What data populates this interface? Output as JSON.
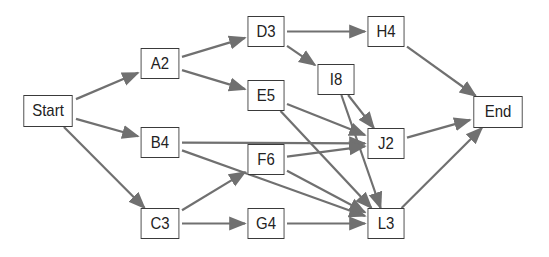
{
  "diagram": {
    "type": "network-flow",
    "edge_color": "#707070",
    "nodes": [
      {
        "id": "Start",
        "label": "Start",
        "x": 20,
        "y": 95,
        "w": 56,
        "h": 32
      },
      {
        "id": "A2",
        "label": "A2",
        "x": 138,
        "y": 48,
        "w": 44,
        "h": 31
      },
      {
        "id": "B4",
        "label": "B4",
        "x": 138,
        "y": 127,
        "w": 44,
        "h": 31
      },
      {
        "id": "C3",
        "label": "C3",
        "x": 138,
        "y": 208,
        "w": 44,
        "h": 31
      },
      {
        "id": "D3",
        "label": "D3",
        "x": 245,
        "y": 16,
        "w": 42,
        "h": 31
      },
      {
        "id": "E5",
        "label": "E5",
        "x": 245,
        "y": 80,
        "w": 42,
        "h": 31
      },
      {
        "id": "F6",
        "label": "F6",
        "x": 245,
        "y": 144,
        "w": 42,
        "h": 31
      },
      {
        "id": "G4",
        "label": "G4",
        "x": 245,
        "y": 208,
        "w": 42,
        "h": 31
      },
      {
        "id": "H4",
        "label": "H4",
        "x": 365,
        "y": 16,
        "w": 42,
        "h": 31
      },
      {
        "id": "I8",
        "label": "I8",
        "x": 315,
        "y": 64,
        "w": 42,
        "h": 31
      },
      {
        "id": "J2",
        "label": "J2",
        "x": 365,
        "y": 128,
        "w": 42,
        "h": 31
      },
      {
        "id": "L3",
        "label": "L3",
        "x": 365,
        "y": 208,
        "w": 42,
        "h": 31
      },
      {
        "id": "End",
        "label": "End",
        "x": 470,
        "y": 96,
        "w": 56,
        "h": 32
      }
    ],
    "edges": [
      {
        "from": "Start",
        "to": "A2"
      },
      {
        "from": "Start",
        "to": "B4"
      },
      {
        "from": "Start",
        "to": "C3"
      },
      {
        "from": "A2",
        "to": "D3"
      },
      {
        "from": "A2",
        "to": "E5"
      },
      {
        "from": "D3",
        "to": "H4"
      },
      {
        "from": "D3",
        "to": "I8"
      },
      {
        "from": "H4",
        "to": "End"
      },
      {
        "from": "E5",
        "to": "J2"
      },
      {
        "from": "E5",
        "to": "L3"
      },
      {
        "from": "I8",
        "to": "J2"
      },
      {
        "from": "I8",
        "to": "L3"
      },
      {
        "from": "B4",
        "to": "J2"
      },
      {
        "from": "B4",
        "to": "L3"
      },
      {
        "from": "C3",
        "to": "F6"
      },
      {
        "from": "C3",
        "to": "G4"
      },
      {
        "from": "F6",
        "to": "J2"
      },
      {
        "from": "F6",
        "to": "L3"
      },
      {
        "from": "G4",
        "to": "L3"
      },
      {
        "from": "J2",
        "to": "End"
      },
      {
        "from": "L3",
        "to": "End"
      }
    ]
  }
}
